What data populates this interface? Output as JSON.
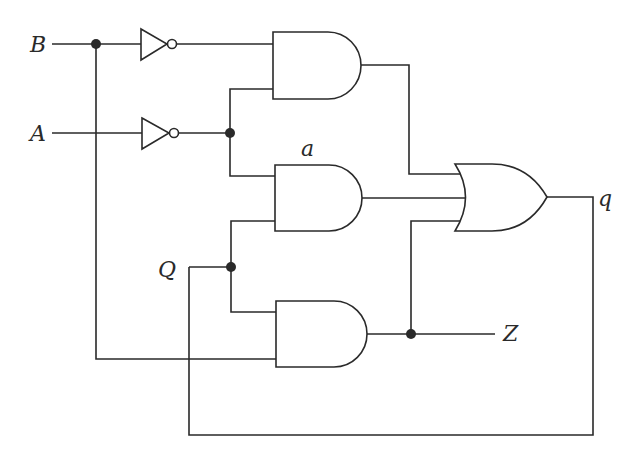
{
  "diagram": {
    "type": "logic-circuit",
    "labels": {
      "input_b": "B",
      "input_a": "A",
      "state_q": "Q",
      "node_a": "a",
      "output_q": "q",
      "output_z": "Z"
    },
    "gates": [
      {
        "id": "not1",
        "type": "NOT",
        "input": "B"
      },
      {
        "id": "not2",
        "type": "NOT",
        "input": "A"
      },
      {
        "id": "and1",
        "type": "AND",
        "inputs": [
          "B'",
          "A'"
        ]
      },
      {
        "id": "and2",
        "type": "AND",
        "inputs": [
          "A'",
          "Q"
        ],
        "label": "a"
      },
      {
        "id": "and3",
        "type": "AND",
        "inputs": [
          "Q",
          "B"
        ]
      },
      {
        "id": "or1",
        "type": "OR",
        "inputs": [
          "and1",
          "and2",
          "and3"
        ],
        "output": "q"
      }
    ],
    "outputs": {
      "q": "OR output, fed back to Q",
      "Z": "AND3 output"
    },
    "colors": {
      "ink": "#2a2a2a",
      "background": "#ffffff"
    }
  }
}
